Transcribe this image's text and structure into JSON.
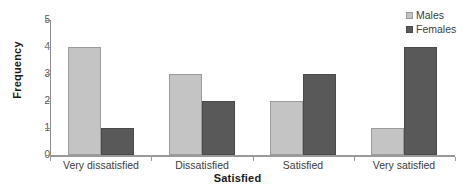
{
  "chart_data": {
    "type": "bar",
    "title": "",
    "xlabel": "Satisfied",
    "ylabel": "Frequency",
    "categories": [
      "Very dissatisfied",
      "Dissatisfied",
      "Satisfied",
      "Very satisfied"
    ],
    "series": [
      {
        "name": "Males",
        "color": "#c4c4c4",
        "values": [
          4,
          3,
          2,
          1
        ]
      },
      {
        "name": "Females",
        "color": "#595959",
        "values": [
          1,
          2,
          3,
          4
        ]
      }
    ],
    "ylim": [
      0,
      5
    ],
    "yticks": [
      0,
      1,
      2,
      3,
      4,
      5
    ],
    "ytick_labels": [
      "0",
      "1",
      "2",
      "3",
      "4",
      "5"
    ],
    "grid": false,
    "legend_position": "top-right"
  },
  "axes": {
    "y_title": "Frequency",
    "x_title": "Satisfied",
    "y_tick_labels": [
      "5",
      "4",
      "3",
      "2",
      "1",
      "0"
    ]
  },
  "legend": {
    "items": [
      {
        "label": "Males",
        "swatch": "legend-swatch-males"
      },
      {
        "label": "Females",
        "swatch": "legend-swatch-females"
      }
    ]
  },
  "categories": [
    {
      "label": "Very dissatisfied"
    },
    {
      "label": "Dissatisfied"
    },
    {
      "label": "Satisfied"
    },
    {
      "label": "Very satisfied"
    }
  ]
}
